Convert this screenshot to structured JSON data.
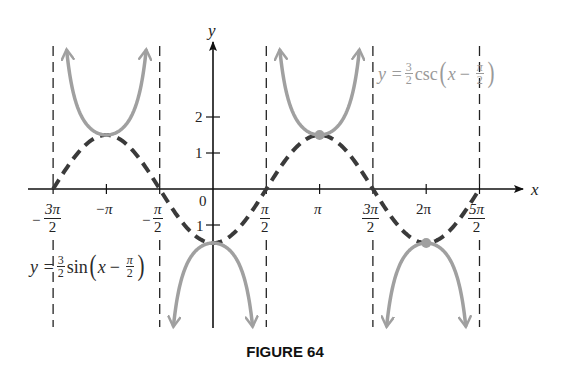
{
  "chart_data": {
    "type": "line",
    "title": "",
    "caption": "FIGURE 64",
    "xlabel": "x",
    "ylabel": "y",
    "x_tick_labels": [
      "-3π/2",
      "-π",
      "-π/2",
      "0",
      "π/2",
      "π",
      "3π/2",
      "2π",
      "5π/2"
    ],
    "x_tick_values": [
      -4.712,
      -3.1416,
      -1.5708,
      0,
      1.5708,
      3.1416,
      4.712,
      6.2832,
      7.854
    ],
    "y_tick_labels": [
      "-1",
      "1",
      "2"
    ],
    "y_tick_values": [
      -1,
      1,
      2
    ],
    "xlim": [
      -4.712,
      7.854
    ],
    "ylim": [
      -3.8,
      3.9
    ],
    "grid": false,
    "series": [
      {
        "name": "y = (3/2) sin(x − π/2)",
        "style": "dashed",
        "color": "#3a3a3a",
        "function": "1.5*sin(x - pi/2)",
        "domain": [
          -4.712,
          7.854
        ],
        "key_points": [
          {
            "x": -4.712,
            "y": 0
          },
          {
            "x": -3.1416,
            "y": 1.5
          },
          {
            "x": -1.5708,
            "y": 0
          },
          {
            "x": 0,
            "y": -1.5
          },
          {
            "x": 1.5708,
            "y": 0
          },
          {
            "x": 3.1416,
            "y": 1.5
          },
          {
            "x": 4.712,
            "y": 0
          },
          {
            "x": 6.2832,
            "y": -1.5
          },
          {
            "x": 7.854,
            "y": 0
          }
        ]
      },
      {
        "name": "y = (3/2) csc(x − π/2)",
        "style": "solid",
        "color": "#a0a0a0",
        "function": "1.5/sin(x - pi/2)",
        "branches": [
          {
            "domain": [
              -4.712,
              -1.5708
            ],
            "vertex": {
              "x": -3.1416,
              "y": 1.5
            },
            "opens": "up"
          },
          {
            "domain": [
              -1.5708,
              1.5708
            ],
            "vertex": {
              "x": 0,
              "y": -1.5
            },
            "opens": "down"
          },
          {
            "domain": [
              1.5708,
              4.712
            ],
            "vertex": {
              "x": 3.1416,
              "y": 1.5
            },
            "opens": "up"
          },
          {
            "domain": [
              4.712,
              7.854
            ],
            "vertex": {
              "x": 6.2832,
              "y": -1.5
            },
            "opens": "down"
          }
        ]
      }
    ],
    "asymptotes": {
      "style": "dashed vertical",
      "x_values": [
        -4.712,
        -1.5708,
        1.5708,
        4.712,
        7.854
      ],
      "x_labels": [
        "-3π/2",
        "-π/2",
        "π/2",
        "3π/2",
        "5π/2"
      ]
    },
    "highlighted_points": [
      {
        "x": 3.1416,
        "y": 1.5
      },
      {
        "x": 6.2832,
        "y": -1.5
      }
    ],
    "annotations": [
      {
        "text": "y = (3/2) csc(x − π/2)",
        "position": "upper right, near x=3π/2"
      },
      {
        "text": "y = (3/2) sin(x − π/2)",
        "position": "lower left, near x=-3π/2"
      }
    ]
  },
  "labels": {
    "y_axis": "y",
    "x_axis": "x",
    "origin": "0",
    "y_one": "1",
    "y_two": "2",
    "y_neg_one": "1",
    "neg_pi": "−π",
    "pi": "π",
    "two_pi": "2π",
    "neg3pi2_num": "3π",
    "neg3pi2_den": "2",
    "negpi2_num": "π",
    "negpi2_den": "2",
    "pi2_num": "π",
    "pi2_den": "2",
    "threepi2_num": "3π",
    "threepi2_den": "2",
    "fivepi2_num": "5π",
    "fivepi2_den": "2",
    "minus": "−"
  },
  "equations": {
    "csc": {
      "lhs": "y =",
      "coef_num": "3",
      "coef_den": "2",
      "fn": "csc",
      "open": "(",
      "var": "x",
      "op": "−",
      "arg_num": "π",
      "arg_den": "2",
      "close": ")"
    },
    "sin": {
      "lhs": "y =",
      "coef_num": "3",
      "coef_den": "2",
      "fn": "sin",
      "open": "(",
      "var": "x",
      "op": "−",
      "arg_num": "π",
      "arg_den": "2",
      "close": ")"
    }
  },
  "caption": "FIGURE 64"
}
